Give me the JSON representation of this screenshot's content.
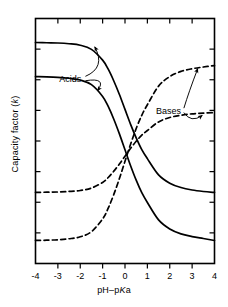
{
  "figure": {
    "title": "",
    "background_color": "#ffffff",
    "line_color": "#000000"
  },
  "axes": {
    "x": {
      "label_prefix": "pH–p",
      "label_italic": "K",
      "label_suffix": "a",
      "label_full": "pH–pKa",
      "min": -4,
      "max": 4,
      "ticks": [
        "-4",
        "-3",
        "-2",
        "-1",
        "0",
        "1",
        "2",
        "3",
        "4"
      ],
      "tick_values": [
        -4,
        -3,
        -2,
        -1,
        0,
        1,
        2,
        3,
        4
      ]
    },
    "y": {
      "label_prefix": "Capacity factor (",
      "label_italic": "k",
      "label_suffix": ")",
      "label_full": "Capacity factor (k)",
      "min": 0,
      "max": 1,
      "ticks": [],
      "tick_count": 8
    }
  },
  "annotations": [
    {
      "name": "acids",
      "text": "Acids",
      "x": -2.45,
      "y": 0.755
    },
    {
      "name": "bases",
      "text": "Bases",
      "x": 1.95,
      "y": 0.625
    }
  ],
  "chart_data": {
    "type": "line",
    "title": "",
    "xlabel": "pH–pKa",
    "ylabel": "Capacity factor (k)",
    "xlim": [
      -4,
      4
    ],
    "ylim": [
      0,
      1
    ],
    "grid": false,
    "legend": "annotations",
    "x": [
      -4,
      -3.5,
      -3,
      -2.5,
      -2,
      -1.5,
      -1,
      -0.75,
      -0.5,
      -0.25,
      0,
      0.25,
      0.5,
      0.75,
      1,
      1.5,
      2,
      2.5,
      3,
      3.5,
      4
    ],
    "series": [
      {
        "name": "Acid 1",
        "group": "Acids",
        "style": "solid",
        "high_plateau": 0.902,
        "low_plateau": 0.29,
        "values": [
          0.902,
          0.901,
          0.9,
          0.897,
          0.891,
          0.874,
          0.83,
          0.793,
          0.745,
          0.69,
          0.629,
          0.568,
          0.513,
          0.465,
          0.428,
          0.362,
          0.328,
          0.31,
          0.3,
          0.294,
          0.29
        ]
      },
      {
        "name": "Acid 2",
        "group": "Acids",
        "style": "solid",
        "high_plateau": 0.763,
        "low_plateau": 0.094,
        "values": [
          0.763,
          0.762,
          0.76,
          0.756,
          0.749,
          0.73,
          0.682,
          0.641,
          0.589,
          0.529,
          0.464,
          0.399,
          0.34,
          0.289,
          0.249,
          0.178,
          0.141,
          0.121,
          0.11,
          0.102,
          0.094
        ]
      },
      {
        "name": "Base 1",
        "group": "Bases",
        "style": "dashed",
        "low_plateau": 0.094,
        "high_plateau": 0.808,
        "values": [
          0.094,
          0.095,
          0.097,
          0.101,
          0.109,
          0.13,
          0.182,
          0.226,
          0.282,
          0.347,
          0.417,
          0.487,
          0.551,
          0.605,
          0.648,
          0.724,
          0.763,
          0.784,
          0.795,
          0.802,
          0.808
        ]
      },
      {
        "name": "Base 2",
        "group": "Bases",
        "style": "dashed",
        "low_plateau": 0.29,
        "high_plateau": 0.616,
        "values": [
          0.29,
          0.291,
          0.292,
          0.294,
          0.298,
          0.308,
          0.331,
          0.351,
          0.377,
          0.406,
          0.438,
          0.47,
          0.499,
          0.524,
          0.543,
          0.578,
          0.596,
          0.605,
          0.611,
          0.614,
          0.616
        ]
      }
    ]
  }
}
